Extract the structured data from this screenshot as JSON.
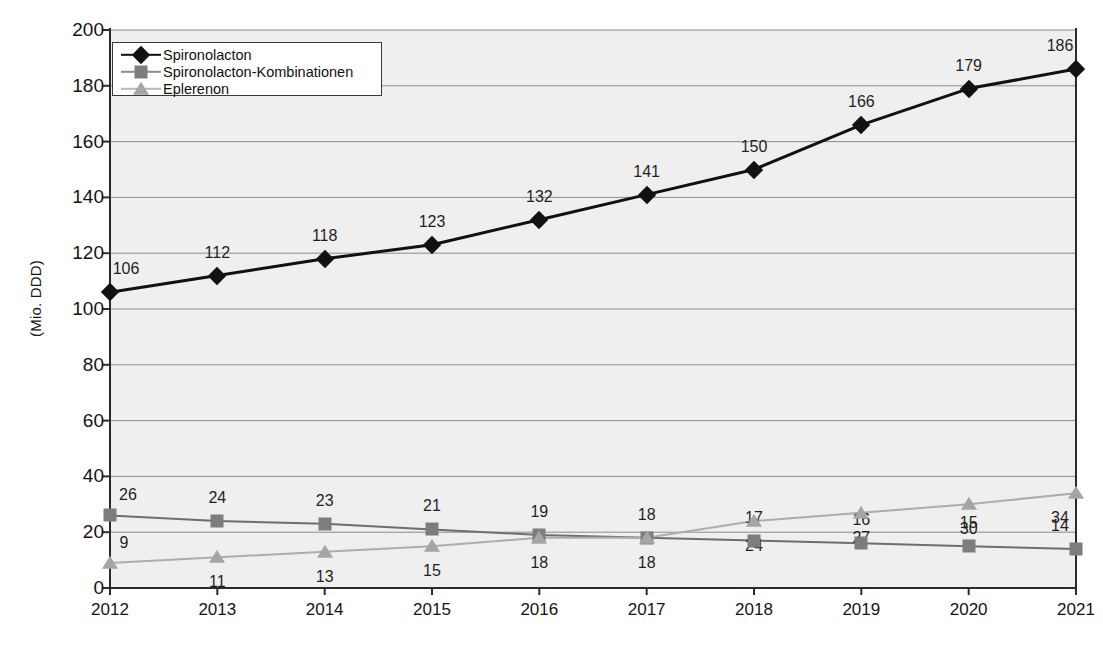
{
  "chart_data": {
    "type": "line",
    "title": "",
    "subtitle": "",
    "xlabel": "",
    "ylabel": "(Mio. DDD)",
    "categories": [
      "2012",
      "2013",
      "2014",
      "2015",
      "2016",
      "2017",
      "2018",
      "2019",
      "2020",
      "2021"
    ],
    "x": [
      2012,
      2013,
      2014,
      2015,
      2016,
      2017,
      2018,
      2019,
      2020,
      2021
    ],
    "ylim": [
      0,
      200
    ],
    "ytick_values": [
      0,
      20,
      40,
      60,
      80,
      100,
      120,
      140,
      160,
      180,
      200
    ],
    "ytick_labels": [
      "0",
      "20",
      "40",
      "60",
      "80",
      "100",
      "120",
      "140",
      "160",
      "180",
      "200"
    ],
    "grid": true,
    "legend_position": "top-left",
    "series": [
      {
        "name": "Spironolacton",
        "marker": "diamond",
        "color": "#111111",
        "line_color": "#111111",
        "label_offset": "above",
        "values": [
          106,
          112,
          118,
          123,
          132,
          141,
          150,
          166,
          179,
          186
        ]
      },
      {
        "name": "Spironolacton-Kombinationen",
        "marker": "square",
        "color": "#7d7d7d",
        "line_color": "#6e6e6e",
        "label_offset": "above",
        "values": [
          26,
          24,
          23,
          21,
          19,
          18,
          17,
          16,
          15,
          14
        ]
      },
      {
        "name": "Eplerenon",
        "marker": "triangle",
        "color": "#a5a5a5",
        "line_color": "#adadad",
        "label_offset": "below",
        "values": [
          9,
          11,
          13,
          15,
          18,
          18,
          24,
          27,
          30,
          34
        ]
      }
    ]
  },
  "colors": {
    "plot_background": "#efefef",
    "grid_line": "#8c8c8c",
    "axis_line": "#2b2b2b",
    "page_background": "#ffffff",
    "text": "#141414"
  }
}
